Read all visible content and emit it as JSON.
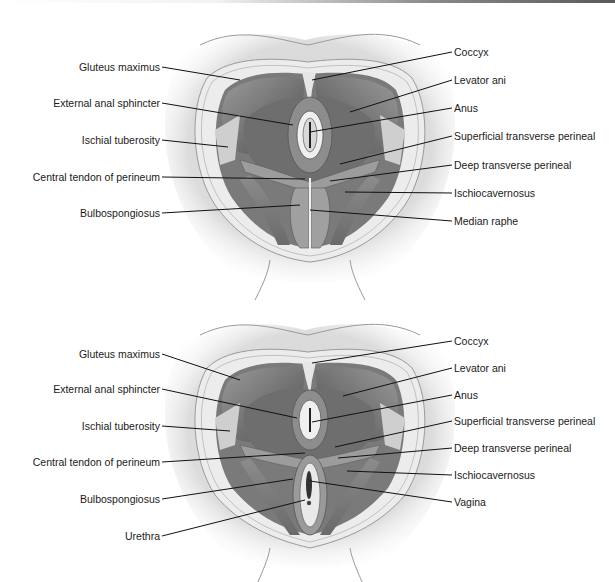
{
  "figure": {
    "type": "anatomical-diagram",
    "panels": [
      {
        "id": "male",
        "left_labels": [
          {
            "text": "Gluteus maximus",
            "y": 67,
            "tx": 240,
            "ty": 80
          },
          {
            "text": "External anal sphincter",
            "y": 103,
            "tx": 293,
            "ty": 125
          },
          {
            "text": "Ischial tuberosity",
            "y": 140,
            "tx": 228,
            "ty": 147
          },
          {
            "text": "Central tendon of perineum",
            "y": 177,
            "tx": 305,
            "ty": 179
          },
          {
            "text": "Bulbospongiosus",
            "y": 213,
            "tx": 300,
            "ty": 205
          }
        ],
        "right_labels": [
          {
            "text": "Coccyx",
            "y": 52,
            "tx": 312,
            "ty": 80
          },
          {
            "text": "Levator ani",
            "y": 80,
            "tx": 350,
            "ty": 112
          },
          {
            "text": "Anus",
            "y": 108,
            "tx": 310,
            "ty": 132
          },
          {
            "text": "Superficial transverse perineal",
            "y": 136,
            "tx": 340,
            "ty": 164
          },
          {
            "text": "Deep transverse perineal",
            "y": 165,
            "tx": 330,
            "ty": 181
          },
          {
            "text": "Ischiocavernosus",
            "y": 193,
            "tx": 345,
            "ty": 192
          },
          {
            "text": "Median raphe",
            "y": 221,
            "tx": 310,
            "ty": 210
          }
        ]
      },
      {
        "id": "female",
        "left_labels": [
          {
            "text": "Gluteus maximus",
            "y": 354,
            "tx": 240,
            "ty": 380
          },
          {
            "text": "External anal sphincter",
            "y": 389,
            "tx": 297,
            "ty": 418
          },
          {
            "text": "Ischial tuberosity",
            "y": 426,
            "tx": 230,
            "ty": 431
          },
          {
            "text": "Central tendon of perineum",
            "y": 462,
            "tx": 305,
            "ty": 453
          },
          {
            "text": "Bulbospongiosus",
            "y": 499,
            "tx": 293,
            "ty": 479
          },
          {
            "text": "Urethra",
            "y": 536,
            "tx": 305,
            "ty": 500
          }
        ],
        "right_labels": [
          {
            "text": "Coccyx",
            "y": 341,
            "tx": 312,
            "ty": 363
          },
          {
            "text": "Levator ani",
            "y": 368,
            "tx": 343,
            "ty": 396
          },
          {
            "text": "Anus",
            "y": 395,
            "tx": 312,
            "ty": 422
          },
          {
            "text": "Superficial transverse perineal",
            "y": 421,
            "tx": 335,
            "ty": 447
          },
          {
            "text": "Deep transverse perineal",
            "y": 448,
            "tx": 338,
            "ty": 458
          },
          {
            "text": "Ischiocavernosus",
            "y": 475,
            "tx": 347,
            "ty": 471
          },
          {
            "text": "Vagina",
            "y": 502,
            "tx": 310,
            "ty": 481
          }
        ]
      }
    ]
  },
  "colors": {
    "muscle_dark": "#5e5e5e",
    "muscle_mid": "#8a8a8a",
    "skin": "#d9d9d9",
    "fat": "#ececec",
    "leader_line": "#111111",
    "text": "#1a1a1a"
  }
}
